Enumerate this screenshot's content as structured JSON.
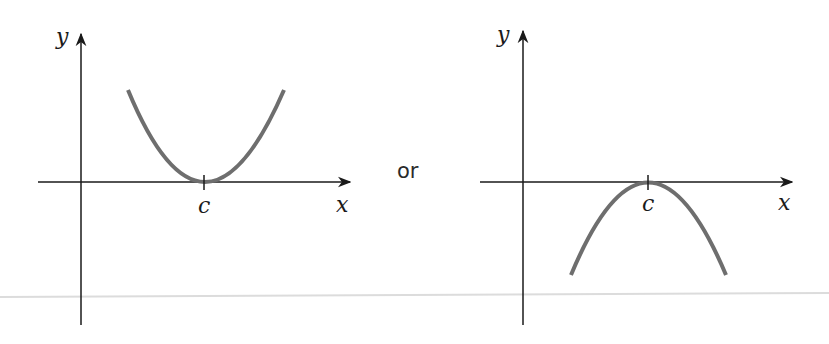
{
  "diagram": {
    "connector_text": "or",
    "colors": {
      "axis": "#1a1a1a",
      "curve": "#6e6e6e",
      "separator": "#dcdcdc"
    },
    "graphs": [
      {
        "id": "upward-parabola",
        "x_label": "x",
        "y_label": "y",
        "tick_label": "c",
        "shape": "parabola opening upward, tangent to x-axis at c"
      },
      {
        "id": "downward-parabola",
        "x_label": "x",
        "y_label": "y",
        "tick_label": "c",
        "shape": "parabola opening downward, tangent to x-axis at c"
      }
    ]
  }
}
